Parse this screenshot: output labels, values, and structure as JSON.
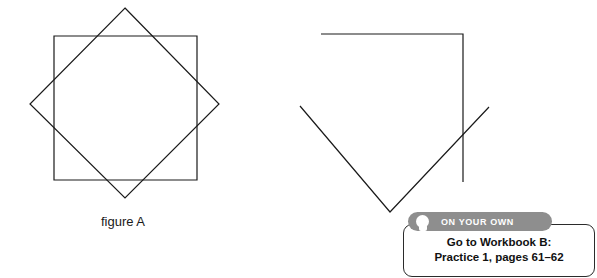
{
  "figures": {
    "figure_a": {
      "caption": "figure A",
      "description": "square overlapped by a rotated square forming an eight-pointed star",
      "shapes": [
        {
          "name": "square",
          "points": "46,36 189,36 189,180 46,180",
          "closed": true
        },
        {
          "name": "rotated-square",
          "points": "117,8 211,104 117,198 22,104",
          "closed": true
        }
      ]
    },
    "figure_b": {
      "caption": "",
      "description": "open polyline resembling an incomplete star point",
      "shapes": [
        {
          "name": "open-polyline",
          "points": "33,20 175,20 175,168",
          "closed": false
        },
        {
          "name": "open-chevron",
          "points": "12,92 102,198 201,93",
          "closed": false
        }
      ]
    }
  },
  "callout": {
    "tab_label": "ON YOUR OWN",
    "tab_icon": "person-icon",
    "line1": "Go to Workbook B:",
    "line2": "Practice 1, pages 61–62",
    "tab_color": "#8e8e8e",
    "border_color": "#2b2b2b"
  }
}
